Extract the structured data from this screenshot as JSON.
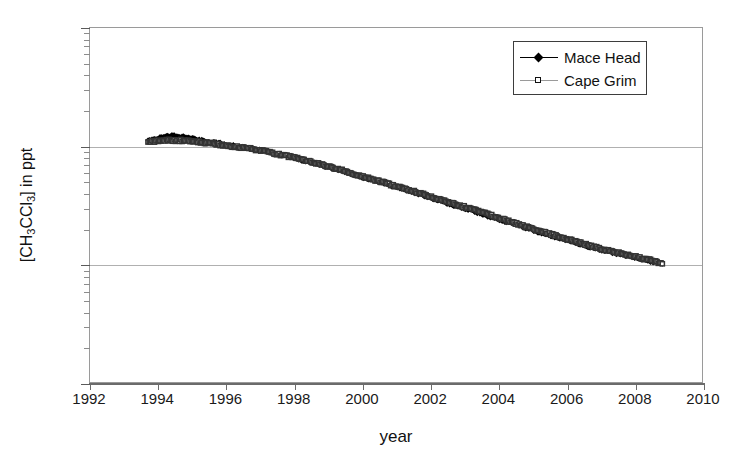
{
  "figure": {
    "width": 744,
    "height": 476,
    "background": "#ffffff"
  },
  "axis_titles": {
    "y_prefix": "[CH",
    "y_sub1": "3",
    "y_mid": "CCl",
    "y_sub2": "3",
    "y_suffix": "] in ppt",
    "y_full": "[CH3CCl3] in ppt",
    "x": "year"
  },
  "legend": {
    "position": "top-right-inside",
    "border_color": "#3d3d3d",
    "entries": [
      {
        "label": "Mace Head",
        "marker": "filled-diamond",
        "line": true,
        "color": "#000000"
      },
      {
        "label": "Cape Grim",
        "marker": "open-square",
        "line": true,
        "color": "#9a9a9a"
      }
    ]
  },
  "chart_data": {
    "type": "line",
    "title": "",
    "subtitle": "",
    "xlabel": "year",
    "ylabel": "[CH3CCl3] in ppt",
    "xlim": [
      1992,
      2010
    ],
    "ylim": [
      1,
      1000
    ],
    "yscale": "log",
    "xscale": "linear",
    "grid": true,
    "grid_axis": "y",
    "legend_position": "upper right",
    "x_ticks": [
      1992,
      1994,
      1996,
      1998,
      2000,
      2002,
      2004,
      2006,
      2008,
      2010
    ],
    "x_tick_labels": [
      "1992",
      "1994",
      "1996",
      "1998",
      "2000",
      "2002",
      "2004",
      "2006",
      "2008",
      "2010"
    ],
    "y_ticks": [
      1,
      10,
      100,
      1000
    ],
    "y_tick_labels": [
      "1",
      "10",
      "100",
      "1000"
    ],
    "y_minor_ticks": [
      2,
      3,
      4,
      5,
      6,
      7,
      8,
      9,
      20,
      30,
      40,
      50,
      60,
      70,
      80,
      90,
      200,
      300,
      400,
      500,
      600,
      700,
      800,
      900
    ],
    "series": [
      {
        "name": "Mace Head",
        "marker": "filled-diamond",
        "color": "#000000",
        "x": [
          1993.7,
          1994.0,
          1994.2,
          1994.4,
          1994.6,
          1994.9,
          1995.2,
          1995.5,
          1995.8,
          1996.1,
          1996.4,
          1996.7,
          1997.0,
          1997.4,
          1997.8,
          1998.2,
          1998.6,
          1999.0,
          1999.5,
          2000.0,
          2000.5,
          2001.0,
          2001.5,
          2002.0,
          2002.5,
          2003.0,
          2003.5,
          2004.0,
          2004.5,
          2005.0,
          2005.5,
          2006.0,
          2006.5,
          2007.0,
          2007.5,
          2008.0,
          2008.5,
          2008.8
        ],
        "y": [
          113,
          118,
          122,
          125,
          123,
          119,
          114,
          110,
          107,
          103,
          100,
          97,
          93,
          88,
          83,
          77,
          72,
          67,
          61,
          55,
          50,
          45,
          41,
          37,
          33,
          30,
          27,
          24,
          22,
          19.6,
          17.8,
          16.1,
          14.6,
          13.4,
          12.4,
          11.5,
          10.7,
          10.3
        ]
      },
      {
        "name": "Cape Grim",
        "marker": "open-square",
        "color": "#333333",
        "x": [
          1993.7,
          1994.0,
          1994.3,
          1994.6,
          1994.9,
          1995.2,
          1995.5,
          1995.8,
          1996.1,
          1996.4,
          1996.7,
          1997.0,
          1997.4,
          1997.8,
          1998.2,
          1998.6,
          1999.0,
          1999.5,
          2000.0,
          2000.5,
          2001.0,
          2001.5,
          2002.0,
          2002.5,
          2003.0,
          2003.5,
          2004.0,
          2004.5,
          2005.0,
          2005.5,
          2006.0,
          2006.5,
          2007.0,
          2007.5,
          2008.0,
          2008.5,
          2008.8
        ],
        "y": [
          110,
          112,
          113,
          113,
          112,
          110,
          107,
          104,
          101,
          99,
          96,
          93,
          88,
          83,
          78,
          73,
          68,
          62,
          56,
          51,
          46,
          42,
          38,
          34,
          31,
          28,
          25,
          22.5,
          20.2,
          18.3,
          16.6,
          15.1,
          13.8,
          12.7,
          11.8,
          11.0,
          10.2
        ]
      }
    ],
    "annotations": []
  }
}
